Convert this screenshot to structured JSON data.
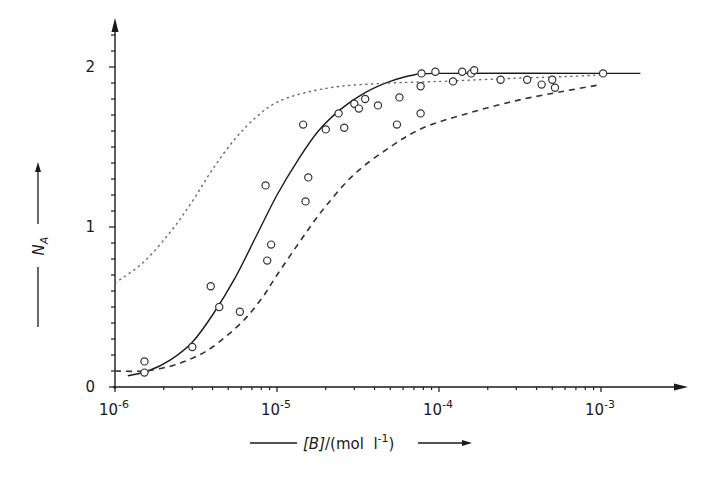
{
  "chart_data": {
    "type": "scatter",
    "title": "",
    "xlabel": "[B]/(mol l^-1)",
    "ylabel": "N_A",
    "xscale": "log",
    "xlim": [
      1e-06,
      0.0018
    ],
    "ylim": [
      0,
      2.2
    ],
    "grid": false,
    "legend": null,
    "x_ticks": [
      {
        "value": 1e-06,
        "base": "10",
        "exp": "-6"
      },
      {
        "value": 1e-05,
        "base": "10",
        "exp": "-5"
      },
      {
        "value": 0.0001,
        "base": "10",
        "exp": "-4"
      },
      {
        "value": 0.001,
        "base": "10",
        "exp": "-3"
      }
    ],
    "y_ticks": [
      {
        "value": 0,
        "label": "0"
      },
      {
        "value": 1,
        "label": "1"
      },
      {
        "value": 2,
        "label": "2"
      }
    ],
    "y_minor_step": 0.1,
    "series": [
      {
        "name": "experimental points",
        "style": "open-circle",
        "points": [
          [
            1.52e-06,
            0.16
          ],
          [
            1.52e-06,
            0.09
          ],
          [
            3e-06,
            0.25
          ],
          [
            3.9e-06,
            0.63
          ],
          [
            4.4e-06,
            0.5
          ],
          [
            5.9e-06,
            0.47
          ],
          [
            8.5e-06,
            1.26
          ],
          [
            8.7e-06,
            0.79
          ],
          [
            9.2e-06,
            0.89
          ],
          [
            1.45e-05,
            1.64
          ],
          [
            1.5e-05,
            1.16
          ],
          [
            1.56e-05,
            1.31
          ],
          [
            2e-05,
            1.61
          ],
          [
            2.4e-05,
            1.71
          ],
          [
            2.6e-05,
            1.62
          ],
          [
            3e-05,
            1.77
          ],
          [
            3.2e-05,
            1.74
          ],
          [
            3.5e-05,
            1.8
          ],
          [
            4.2e-05,
            1.76
          ],
          [
            5.5e-05,
            1.64
          ],
          [
            5.7e-05,
            1.81
          ],
          [
            7.7e-05,
            1.88
          ],
          [
            7.7e-05,
            1.71
          ],
          [
            7.8e-05,
            1.96
          ],
          [
            9.5e-05,
            1.97
          ],
          [
            0.000122,
            1.91
          ],
          [
            0.000139,
            1.97
          ],
          [
            0.000158,
            1.96
          ],
          [
            0.000165,
            1.98
          ],
          [
            0.00024,
            1.92
          ],
          [
            0.00035,
            1.92
          ],
          [
            0.00043,
            1.89
          ],
          [
            0.0005,
            1.92
          ],
          [
            0.00052,
            1.87
          ],
          [
            0.00103,
            1.96
          ]
        ]
      },
      {
        "name": "fitted curve",
        "style": "solid",
        "points": [
          [
            1.2e-06,
            0.07
          ],
          [
            1.6e-06,
            0.1
          ],
          [
            2.2e-06,
            0.17
          ],
          [
            3e-06,
            0.28
          ],
          [
            4e-06,
            0.45
          ],
          [
            5.5e-06,
            0.68
          ],
          [
            7.5e-06,
            0.95
          ],
          [
            1e-05,
            1.2
          ],
          [
            1.35e-05,
            1.42
          ],
          [
            1.8e-05,
            1.6
          ],
          [
            2.5e-05,
            1.74
          ],
          [
            3.5e-05,
            1.84
          ],
          [
            5e-05,
            1.91
          ],
          [
            7e-05,
            1.95
          ],
          [
            0.0001,
            1.96
          ],
          [
            0.001,
            1.96
          ],
          [
            0.00175,
            1.96
          ]
        ]
      },
      {
        "name": "dotted curve",
        "style": "dotted",
        "points": [
          [
            1e-06,
            0.65
          ],
          [
            1.5e-06,
            0.78
          ],
          [
            2.2e-06,
            0.97
          ],
          [
            3e-06,
            1.16
          ],
          [
            4e-06,
            1.36
          ],
          [
            5.5e-06,
            1.55
          ],
          [
            7.5e-06,
            1.69
          ],
          [
            1e-05,
            1.78
          ],
          [
            1.5e-05,
            1.84
          ],
          [
            2.5e-05,
            1.88
          ],
          [
            5e-05,
            1.9
          ],
          [
            0.0001,
            1.91
          ],
          [
            0.0003,
            1.93
          ],
          [
            0.0006,
            1.94
          ],
          [
            0.001,
            1.95
          ]
        ]
      },
      {
        "name": "dashed curve",
        "style": "dashed",
        "points": [
          [
            1e-06,
            0.1
          ],
          [
            1.5e-06,
            0.1
          ],
          [
            2.2e-06,
            0.13
          ],
          [
            3e-06,
            0.18
          ],
          [
            4e-06,
            0.25
          ],
          [
            6e-06,
            0.4
          ],
          [
            8e-06,
            0.55
          ],
          [
            1e-05,
            0.7
          ],
          [
            1.5e-05,
            0.96
          ],
          [
            2e-05,
            1.13
          ],
          [
            3e-05,
            1.33
          ],
          [
            5e-05,
            1.5
          ],
          [
            8e-05,
            1.62
          ],
          [
            0.00015,
            1.71
          ],
          [
            0.0003,
            1.79
          ],
          [
            0.0006,
            1.85
          ],
          [
            0.001,
            1.89
          ]
        ]
      }
    ]
  },
  "axes": {
    "x_title": {
      "prefix_rule": "——",
      "var": "[B]",
      "slash": "/",
      "unit_open": "(mol  l",
      "unit_exp": "-1",
      "unit_close": ")"
    },
    "y_title": {
      "var": "N",
      "sub": "A"
    }
  }
}
